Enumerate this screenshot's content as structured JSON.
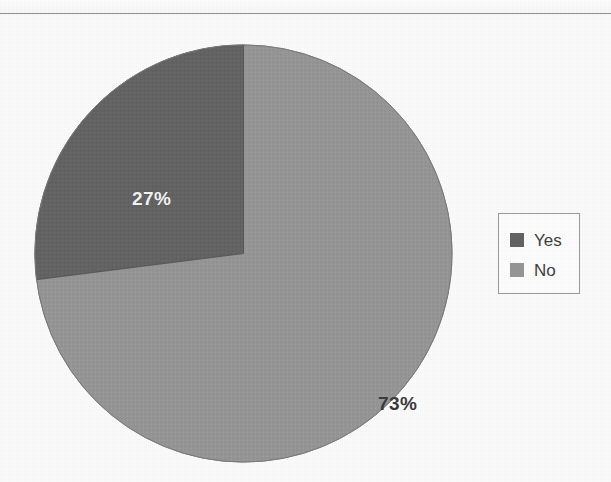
{
  "page": {
    "background_color": "#fbfbfb",
    "width": 611,
    "height": 482
  },
  "divider": {
    "name": "top-horizontal-rule",
    "color": "#8e8e8e"
  },
  "legend": {
    "position": "right",
    "border_color": "#9b9b9b",
    "background_color": "#fdfdfd",
    "items": [
      {
        "label": "Yes",
        "color": "#636363"
      },
      {
        "label": "No",
        "color": "#969696"
      }
    ]
  },
  "chart_data": {
    "type": "pie",
    "title": "",
    "subtitle": "",
    "xlabel": "",
    "ylabel": "",
    "categories": [
      "Yes",
      "No"
    ],
    "values": [
      27,
      73
    ],
    "value_unit": "%",
    "data_labels": [
      "27%",
      "73%"
    ],
    "colors": [
      "#636363",
      "#969696"
    ],
    "label_text_colors": [
      "#f4f4f4",
      "#3b3b3b"
    ],
    "start_angle_deg": 0,
    "direction": "counterclockwise-for-first-slice",
    "legend": true,
    "legend_position": "right",
    "grid": false,
    "annotations": []
  }
}
